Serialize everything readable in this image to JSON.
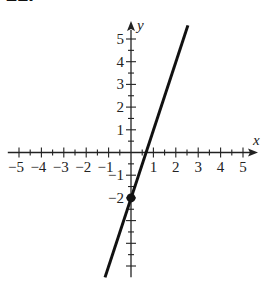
{
  "problem_number": "21.",
  "chart_data": {
    "type": "line",
    "title": "",
    "xlabel": "x",
    "ylabel": "y",
    "xlim": [
      -5.5,
      5.6
    ],
    "ylim": [
      -5.5,
      5.7
    ],
    "grid": false,
    "x_ticks": [
      -5,
      -4,
      -3,
      -2,
      -1,
      1,
      2,
      3,
      4,
      5
    ],
    "y_ticks": [
      -2,
      -1,
      1,
      2,
      3,
      4,
      5
    ],
    "x_tick_labels": [
      "−5",
      "−4",
      "−3",
      "−2",
      "−1",
      "1",
      "2",
      "3",
      "4",
      "5"
    ],
    "y_tick_labels": [
      "−2",
      "−1",
      "1",
      "2",
      "3",
      "4",
      "5"
    ],
    "minor_tick_step": 0.5,
    "series": [
      {
        "name": "y = 3x − 2",
        "slope": 3,
        "intercept": -2,
        "x": [
          -1.16,
          2.54
        ],
        "y": [
          -5.5,
          5.6
        ],
        "color": "#111111"
      }
    ],
    "points": [
      {
        "x": 0,
        "y": -2,
        "label": "y-intercept",
        "style": "filled-dot"
      }
    ]
  },
  "layout": {
    "origin_px": [
      131,
      152.5
    ],
    "unit_x_px": 22.4,
    "unit_y_px": 22.7,
    "line_color": "#111111",
    "axis_color": "#222222"
  }
}
